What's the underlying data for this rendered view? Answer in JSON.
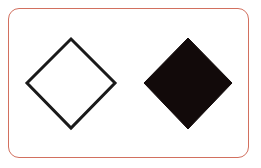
{
  "figure": {
    "border_color": "#d2705f",
    "shapes": [
      {
        "name": "outline-diamond",
        "fill": "none",
        "stroke": "#1a1a1a",
        "points": "71,39 115,83 71,128 27,83"
      },
      {
        "name": "filled-diamond",
        "fill": "#120a0a",
        "stroke": "#120a0a",
        "points": "188,38 232,83 188,129 144,83"
      }
    ]
  }
}
